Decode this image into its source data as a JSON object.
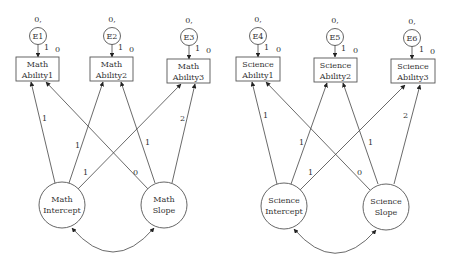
{
  "diagram": {
    "type": "latent growth curve model (path diagram)",
    "colors": {
      "stroke": "#444444",
      "text": "#333333",
      "background": "#ffffff"
    },
    "panels": [
      {
        "name": "math",
        "errors": [
          {
            "label": "E1",
            "mean_var": "0,",
            "path_label": "1",
            "intercept": "0"
          },
          {
            "label": "E2",
            "mean_var": "0,",
            "path_label": "1",
            "intercept": "0"
          },
          {
            "label": "E3",
            "mean_var": "0,",
            "path_label": "1",
            "intercept": "0"
          }
        ],
        "observed": [
          {
            "line1": "Math",
            "line2": "Ability1"
          },
          {
            "line1": "Math",
            "line2": "Ability2"
          },
          {
            "line1": "Math",
            "line2": "Ability3"
          }
        ],
        "latent": [
          {
            "line1": "Math",
            "line2": "Intercept"
          },
          {
            "line1": "Math",
            "line2": "Slope"
          }
        ],
        "loadings": {
          "intercept": [
            "1",
            "1",
            "1"
          ],
          "slope": [
            "0",
            "1",
            "2"
          ]
        }
      },
      {
        "name": "science",
        "errors": [
          {
            "label": "E4",
            "mean_var": "0,",
            "path_label": "1",
            "intercept": "0"
          },
          {
            "label": "E5",
            "mean_var": "0,",
            "path_label": "1",
            "intercept": "0"
          },
          {
            "label": "E6",
            "mean_var": "0,",
            "path_label": "1",
            "intercept": "0"
          }
        ],
        "observed": [
          {
            "line1": "Science",
            "line2": "Ability1"
          },
          {
            "line1": "Science",
            "line2": "Ability2"
          },
          {
            "line1": "Science",
            "line2": "Ability3"
          }
        ],
        "latent": [
          {
            "line1": "Science",
            "line2": "Intercept"
          },
          {
            "line1": "Science",
            "line2": "Slope"
          }
        ],
        "loadings": {
          "intercept": [
            "1",
            "1",
            "1"
          ],
          "slope": [
            "0",
            "1",
            "2"
          ]
        }
      }
    ]
  }
}
